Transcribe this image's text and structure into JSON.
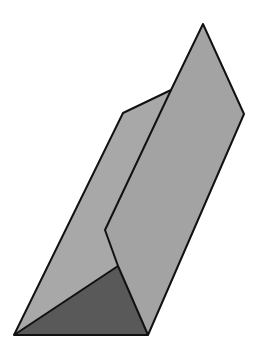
{
  "diagram": {
    "colors": {
      "background": "#ffffff",
      "face_light": "#a3a3a3",
      "face_back": "#a8a8a8",
      "face_dark": "#595959",
      "stroke": "#111111"
    },
    "faces": {
      "back_face": "14,335 123,113 171,90 105,230 118,266",
      "front_face": "171,90 203,24 244,114 148,335 118,266 105,230",
      "bottom_triangle": "14,335 118,266 148,335"
    },
    "edges": {
      "outline": "14,335 123,113 171,90 203,24 244,114 148,335 14,335",
      "crease": "171,90 105,230 118,266 148,335",
      "diag": "14,335 118,266"
    }
  }
}
